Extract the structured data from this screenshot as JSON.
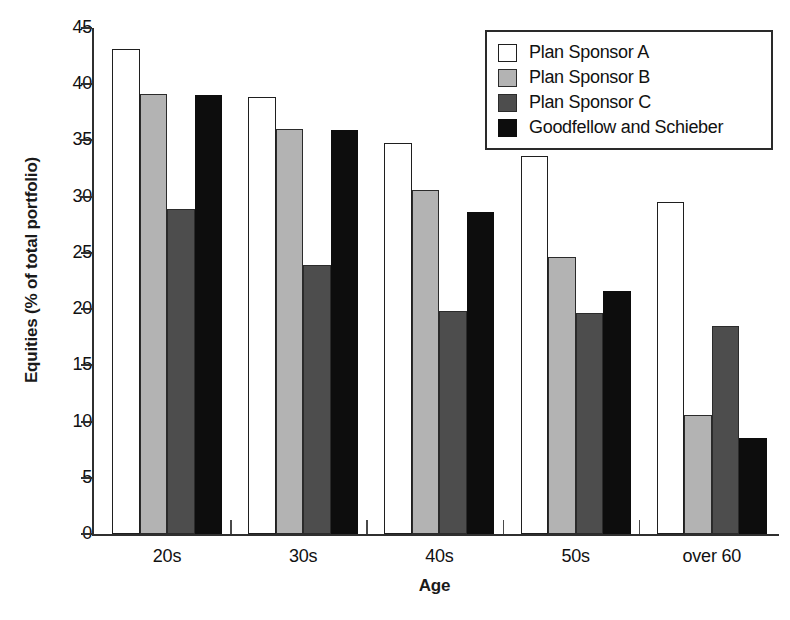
{
  "chart_data": {
    "type": "bar",
    "title": "",
    "xlabel": "Age",
    "ylabel": "Equities (% of total portfolio)",
    "categories": [
      "20s",
      "30s",
      "40s",
      "50s",
      "over 60"
    ],
    "series": [
      {
        "name": "Plan Sponsor A",
        "color": "#ffffff",
        "values": [
          43.1,
          38.9,
          34.8,
          33.6,
          29.5
        ]
      },
      {
        "name": "Plan Sponsor B",
        "color": "#b3b3b3",
        "values": [
          39.1,
          36.0,
          30.6,
          24.6,
          10.6
        ]
      },
      {
        "name": "Plan Sponsor C",
        "color": "#4d4d4d",
        "values": [
          28.9,
          23.9,
          19.8,
          19.7,
          18.5
        ]
      },
      {
        "name": "Goodfellow and Schieber",
        "color": "#0d0d0d",
        "values": [
          39.0,
          35.9,
          28.6,
          21.6,
          8.5
        ]
      }
    ],
    "ylim": [
      0,
      45
    ],
    "yticks": [
      0,
      5,
      10,
      15,
      20,
      25,
      30,
      35,
      40,
      45
    ],
    "ytick_labels": [
      "0",
      "5",
      "10",
      "15",
      "20",
      "25",
      "30",
      "35",
      "40",
      "45"
    ],
    "grid": false,
    "legend_position": "top-right"
  },
  "legend": {
    "entries": [
      {
        "label": "Plan Sponsor A"
      },
      {
        "label": "Plan Sponsor B"
      },
      {
        "label": "Plan Sponsor C"
      },
      {
        "label": "Goodfellow and Schieber"
      }
    ]
  }
}
